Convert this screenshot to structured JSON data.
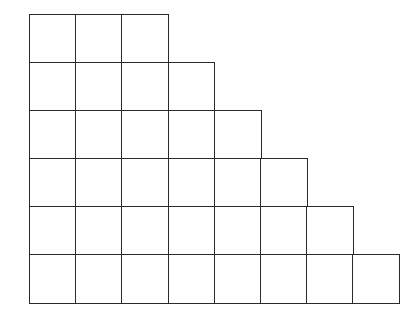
{
  "diagram": {
    "type": "staircase-grid",
    "line_color": "#2a2a2a",
    "background": "#ffffff",
    "origin": {
      "x": 29,
      "y": 14
    },
    "cell_width": 46.2,
    "cell_height": 48,
    "rows": [
      {
        "index": 1,
        "cells": 3
      },
      {
        "index": 2,
        "cells": 4
      },
      {
        "index": 3,
        "cells": 5
      },
      {
        "index": 4,
        "cells": 6
      },
      {
        "index": 5,
        "cells": 7
      },
      {
        "index": 6,
        "cells": 8
      }
    ],
    "total_cells": 33
  }
}
